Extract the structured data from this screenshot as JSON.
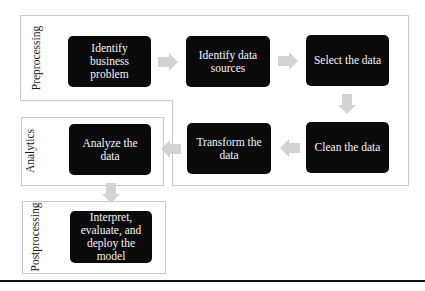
{
  "diagram": {
    "stages": [
      {
        "label": "Preprocessing"
      },
      {
        "label": "Analytics"
      },
      {
        "label": "Postprocessing"
      }
    ],
    "steps": [
      {
        "label": "Identify business problem",
        "stage": "Preprocessing"
      },
      {
        "label": "Identify data sources",
        "stage": "Preprocessing"
      },
      {
        "label": "Select the data",
        "stage": "Preprocessing"
      },
      {
        "label": "Clean the data",
        "stage": "Preprocessing"
      },
      {
        "label": "Transform the data",
        "stage": "Preprocessing"
      },
      {
        "label": "Analyze the data",
        "stage": "Analytics"
      },
      {
        "label": "Interpret, evaluate, and deploy the model",
        "stage": "Postprocessing"
      }
    ],
    "flow": [
      [
        "Identify business problem",
        "Identify data sources"
      ],
      [
        "Identify data sources",
        "Select the data"
      ],
      [
        "Select the data",
        "Clean the data"
      ],
      [
        "Clean the data",
        "Transform the data"
      ],
      [
        "Transform the data",
        "Analyze the data"
      ],
      [
        "Analyze the data",
        "Interpret, evaluate, and deploy the model"
      ]
    ],
    "colors": {
      "box_fill": "#0a0a0a",
      "box_text": "#f4f4f4",
      "arrow": "#d3d3d3",
      "frame_border": "#c9c9c9"
    }
  }
}
